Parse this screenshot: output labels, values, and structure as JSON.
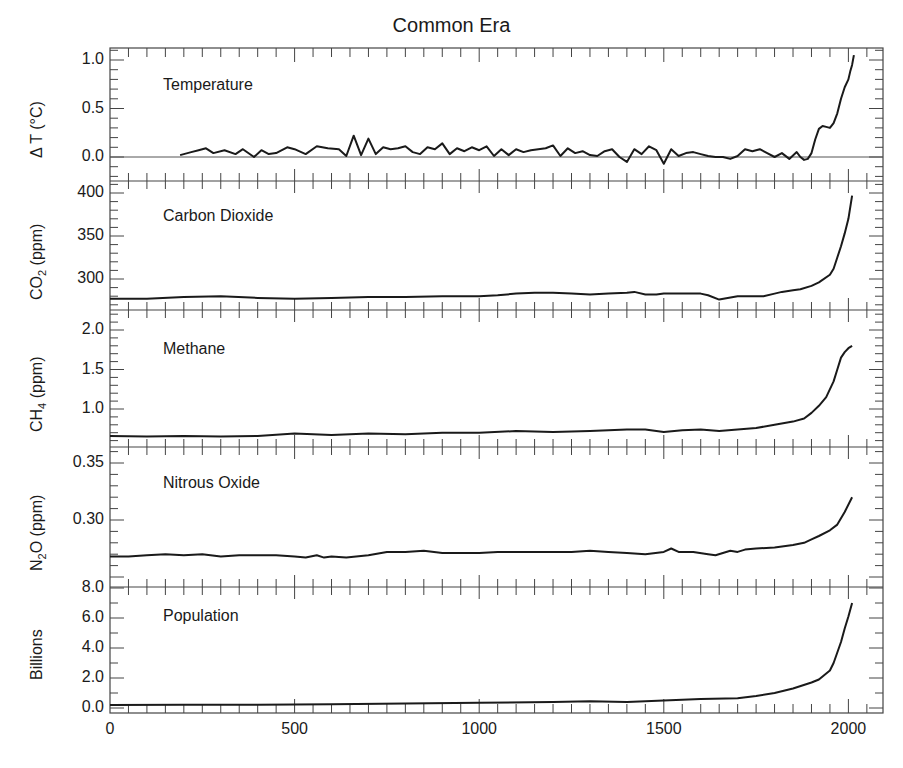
{
  "chart_data": {
    "type": "line",
    "title": "Common Era",
    "xlabel": "",
    "x_ticks": [
      0,
      500,
      1000,
      1500,
      2000
    ],
    "xlim": [
      0,
      2100
    ],
    "panels": [
      {
        "name": "Temperature",
        "label": "Temperature",
        "ylabel": "Δ T (°C)",
        "ylim": [
          -0.25,
          1.1
        ],
        "y_ticks": [
          "1.0",
          "0.5",
          "0.0"
        ],
        "y_tick_values": [
          1.0,
          0.5,
          0.0
        ],
        "zero_line": true,
        "series": {
          "x": [
            190,
            220,
            240,
            260,
            280,
            310,
            340,
            360,
            390,
            410,
            430,
            450,
            480,
            500,
            530,
            560,
            590,
            620,
            640,
            660,
            680,
            700,
            720,
            740,
            760,
            780,
            800,
            820,
            840,
            860,
            880,
            900,
            920,
            940,
            960,
            980,
            1000,
            1020,
            1040,
            1060,
            1080,
            1100,
            1120,
            1140,
            1160,
            1180,
            1200,
            1220,
            1240,
            1260,
            1280,
            1300,
            1320,
            1340,
            1360,
            1380,
            1400,
            1420,
            1440,
            1460,
            1480,
            1500,
            1520,
            1540,
            1560,
            1580,
            1600,
            1620,
            1640,
            1660,
            1680,
            1700,
            1720,
            1740,
            1760,
            1780,
            1800,
            1820,
            1840,
            1860,
            1870,
            1880,
            1890,
            1900,
            1910,
            1920,
            1930,
            1940,
            1950,
            1960,
            1970,
            1980,
            1990,
            2000,
            2005,
            2010,
            2015
          ],
          "y": [
            0.02,
            0.05,
            0.07,
            0.09,
            0.04,
            0.07,
            0.03,
            0.08,
            0.0,
            0.07,
            0.03,
            0.04,
            0.1,
            0.08,
            0.03,
            0.11,
            0.09,
            0.08,
            0.01,
            0.22,
            0.02,
            0.19,
            0.03,
            0.1,
            0.08,
            0.09,
            0.11,
            0.05,
            0.03,
            0.1,
            0.08,
            0.14,
            0.03,
            0.09,
            0.06,
            0.1,
            0.07,
            0.11,
            0.01,
            0.08,
            0.02,
            0.08,
            0.05,
            0.07,
            0.08,
            0.09,
            0.12,
            0.01,
            0.09,
            0.04,
            0.06,
            0.02,
            0.01,
            0.06,
            0.08,
            0.0,
            -0.05,
            0.08,
            0.03,
            0.11,
            0.07,
            -0.07,
            0.08,
            0.01,
            0.04,
            0.05,
            0.03,
            0.01,
            0.0,
            0.0,
            -0.02,
            0.01,
            0.08,
            0.06,
            0.08,
            0.04,
            0.0,
            0.04,
            -0.02,
            0.05,
            0.0,
            -0.03,
            -0.02,
            0.04,
            0.18,
            0.29,
            0.32,
            0.31,
            0.3,
            0.35,
            0.45,
            0.6,
            0.72,
            0.8,
            0.88,
            0.95,
            1.05
          ]
        }
      },
      {
        "name": "Carbon Dioxide",
        "label": "Carbon Dioxide",
        "ylabel": "CO2 (ppm)",
        "ylim": [
          265,
          410
        ],
        "y_ticks": [
          "400",
          "350",
          "300"
        ],
        "y_tick_values": [
          400,
          350,
          300
        ],
        "series": {
          "x": [
            0,
            100,
            200,
            300,
            400,
            500,
            600,
            700,
            800,
            900,
            1000,
            1050,
            1100,
            1150,
            1200,
            1250,
            1300,
            1350,
            1400,
            1420,
            1450,
            1480,
            1500,
            1540,
            1560,
            1600,
            1620,
            1650,
            1700,
            1750,
            1770,
            1800,
            1820,
            1850,
            1870,
            1900,
            1920,
            1950,
            1960,
            1970,
            1980,
            1990,
            2000,
            2010
          ],
          "y": [
            277,
            277,
            279,
            280,
            278,
            277,
            278,
            279,
            279,
            280,
            280,
            281,
            283,
            284,
            284,
            283,
            282,
            283,
            284,
            285,
            282,
            282,
            283,
            283,
            283,
            283,
            281,
            276,
            280,
            280,
            280,
            283,
            285,
            287,
            288,
            292,
            296,
            305,
            312,
            325,
            338,
            353,
            370,
            397
          ]
        }
      },
      {
        "name": "Methane",
        "label": "Methane",
        "ylabel": "CH4 (ppm)",
        "ylim": [
          0.6,
          2.1
        ],
        "y_ticks": [
          "2.0",
          "1.5",
          "1.0"
        ],
        "y_tick_values": [
          2.0,
          1.5,
          1.0
        ],
        "series": {
          "x": [
            0,
            100,
            200,
            300,
            400,
            500,
            600,
            700,
            800,
            900,
            1000,
            1100,
            1200,
            1300,
            1400,
            1450,
            1500,
            1550,
            1600,
            1650,
            1700,
            1750,
            1800,
            1850,
            1880,
            1900,
            1920,
            1940,
            1960,
            1970,
            1980,
            1990,
            2000,
            2010
          ],
          "y": [
            0.66,
            0.65,
            0.66,
            0.65,
            0.66,
            0.69,
            0.67,
            0.69,
            0.68,
            0.7,
            0.7,
            0.72,
            0.71,
            0.72,
            0.74,
            0.74,
            0.71,
            0.73,
            0.74,
            0.72,
            0.74,
            0.76,
            0.8,
            0.84,
            0.88,
            0.95,
            1.04,
            1.15,
            1.35,
            1.5,
            1.65,
            1.72,
            1.77,
            1.8
          ]
        }
      },
      {
        "name": "Nitrous Oxide",
        "label": "Nitrous Oxide",
        "ylabel": "N2O (ppm)",
        "ylim": [
          0.255,
          0.355
        ],
        "y_ticks": [
          "0.35",
          "0.30"
        ],
        "y_tick_values": [
          0.35,
          0.3
        ],
        "series": {
          "x": [
            0,
            50,
            100,
            150,
            200,
            250,
            300,
            350,
            400,
            450,
            500,
            530,
            560,
            580,
            600,
            640,
            700,
            750,
            800,
            850,
            900,
            950,
            1000,
            1050,
            1100,
            1150,
            1200,
            1250,
            1300,
            1350,
            1400,
            1450,
            1500,
            1520,
            1540,
            1580,
            1620,
            1640,
            1680,
            1700,
            1720,
            1750,
            1800,
            1850,
            1880,
            1900,
            1920,
            1950,
            1970,
            1990,
            2010
          ],
          "y": [
            0.268,
            0.268,
            0.269,
            0.27,
            0.269,
            0.27,
            0.268,
            0.269,
            0.269,
            0.269,
            0.268,
            0.267,
            0.269,
            0.267,
            0.268,
            0.267,
            0.269,
            0.272,
            0.272,
            0.273,
            0.271,
            0.271,
            0.271,
            0.272,
            0.272,
            0.272,
            0.272,
            0.272,
            0.273,
            0.272,
            0.271,
            0.27,
            0.272,
            0.275,
            0.272,
            0.272,
            0.27,
            0.269,
            0.273,
            0.272,
            0.274,
            0.275,
            0.276,
            0.278,
            0.28,
            0.283,
            0.286,
            0.291,
            0.296,
            0.307,
            0.32
          ]
        }
      },
      {
        "name": "Population",
        "label": "Population",
        "ylabel": "Billions",
        "ylim": [
          -0.4,
          8.2
        ],
        "y_ticks": [
          "8.0",
          "6.0",
          "4.0",
          "2.0",
          "0.0"
        ],
        "y_tick_values": [
          8.0,
          6.0,
          4.0,
          2.0,
          0.0
        ],
        "series": {
          "x": [
            0,
            200,
            400,
            600,
            800,
            1000,
            1200,
            1300,
            1400,
            1500,
            1600,
            1700,
            1750,
            1800,
            1850,
            1900,
            1920,
            1950,
            1960,
            1970,
            1980,
            1990,
            2000,
            2010
          ],
          "y": [
            0.2,
            0.22,
            0.22,
            0.25,
            0.3,
            0.35,
            0.4,
            0.45,
            0.4,
            0.5,
            0.6,
            0.65,
            0.8,
            1.0,
            1.3,
            1.7,
            1.9,
            2.5,
            3.0,
            3.7,
            4.4,
            5.3,
            6.1,
            7.0
          ]
        }
      }
    ]
  }
}
